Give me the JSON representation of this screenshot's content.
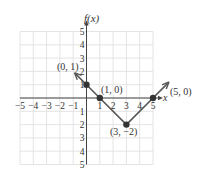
{
  "chart_data": {
    "type": "line",
    "title": "",
    "xlabel": "x",
    "ylabel": "f(x)",
    "xlim": [
      -5,
      5
    ],
    "ylim": [
      -5,
      5
    ],
    "grid": true,
    "x_ticks": [
      "-5",
      "-4",
      "-3",
      "-2",
      "-1",
      "1",
      "2",
      "3",
      "4",
      "5"
    ],
    "y_ticks": [
      "5",
      "4",
      "3",
      "2",
      "1",
      "-1",
      "-2",
      "-3",
      "-4",
      "-5"
    ],
    "series": [
      {
        "name": "f(x)",
        "points": [
          [
            -0.8,
            1.8
          ],
          [
            0,
            1
          ],
          [
            1,
            0
          ],
          [
            3,
            -2
          ],
          [
            5,
            0
          ],
          [
            6.1,
            1.1
          ]
        ],
        "arrow_ends": true,
        "color": "#555555"
      }
    ],
    "marked_points": [
      {
        "x": 0,
        "y": 1,
        "label": "(0, 1)"
      },
      {
        "x": 1,
        "y": 0,
        "label": "(1, 0)"
      },
      {
        "x": 3,
        "y": -2,
        "label": "(3, −2)"
      },
      {
        "x": 5,
        "y": 0,
        "label": "(5, 0)"
      }
    ]
  },
  "labels": {
    "y_axis": "f(x)",
    "x_axis": "x",
    "p1": "(0, 1)",
    "p2": "(1, 0)",
    "p3": "(3, −2)",
    "p4": "(5, 0)"
  },
  "colors": {
    "grid": "#dddddd",
    "axis": "#444444",
    "line": "#555555",
    "point": "#333333"
  }
}
